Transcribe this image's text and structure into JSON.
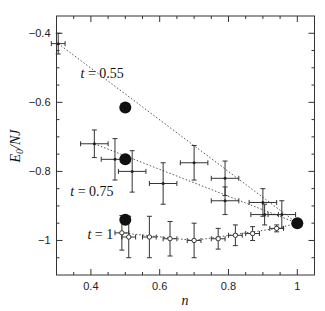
{
  "chart_data": {
    "type": "scatter",
    "title": "",
    "xlabel": "n",
    "ylabel": "E0/NJ",
    "xlim": [
      0.3,
      1.05
    ],
    "ylim": [
      -1.1,
      -0.35
    ],
    "xticks": [
      0.4,
      0.6,
      0.8,
      1
    ],
    "xtick_labels": [
      "0.4",
      "0.6",
      "0.8",
      "1"
    ],
    "yticks": [
      -0.4,
      -0.6,
      -0.8,
      -1
    ],
    "ytick_labels": [
      "−0.4",
      "−0.6",
      "−0.8",
      "−1"
    ],
    "grid": false,
    "series": [
      {
        "name": "t = 0.55",
        "label": "t = 0.55",
        "marker": "cross",
        "points": [
          {
            "x": 0.305,
            "y": -0.43,
            "xerr": 0.02,
            "yerr": 0.03
          },
          {
            "x": 0.7,
            "y": -0.775,
            "xerr": 0.04,
            "yerr": 0.05
          },
          {
            "x": 0.79,
            "y": -0.82,
            "xerr": 0.04,
            "yerr": 0.05
          },
          {
            "x": 0.9,
            "y": -0.89,
            "xerr": 0.04,
            "yerr": 0.04
          },
          {
            "x": 0.955,
            "y": -0.925,
            "xerr": 0.04,
            "yerr": 0.04
          }
        ]
      },
      {
        "name": "t = 0.75",
        "label": "t = 0.75",
        "marker": "cross",
        "points": [
          {
            "x": 0.41,
            "y": -0.72,
            "xerr": 0.04,
            "yerr": 0.04
          },
          {
            "x": 0.47,
            "y": -0.765,
            "xerr": 0.04,
            "yerr": 0.06
          },
          {
            "x": 0.52,
            "y": -0.8,
            "xerr": 0.04,
            "yerr": 0.06
          },
          {
            "x": 0.61,
            "y": -0.835,
            "xerr": 0.04,
            "yerr": 0.06
          },
          {
            "x": 0.79,
            "y": -0.885,
            "xerr": 0.04,
            "yerr": 0.04
          },
          {
            "x": 0.905,
            "y": -0.925,
            "xerr": 0.04,
            "yerr": 0.03
          }
        ]
      },
      {
        "name": "t = 1",
        "label": "t = 1",
        "marker": "open-circle",
        "points": [
          {
            "x": 0.49,
            "y": -0.978,
            "xerr": 0.02,
            "yerr": 0.05
          },
          {
            "x": 0.51,
            "y": -0.99,
            "xerr": 0.02,
            "yerr": 0.06
          },
          {
            "x": 0.57,
            "y": -0.99,
            "xerr": 0.02,
            "yerr": 0.06
          },
          {
            "x": 0.63,
            "y": -0.995,
            "xerr": 0.02,
            "yerr": 0.05
          },
          {
            "x": 0.7,
            "y": -1.0,
            "xerr": 0.02,
            "yerr": 0.05
          },
          {
            "x": 0.77,
            "y": -0.995,
            "xerr": 0.02,
            "yerr": 0.03
          },
          {
            "x": 0.82,
            "y": -0.985,
            "xerr": 0.02,
            "yerr": 0.03
          },
          {
            "x": 0.87,
            "y": -0.98,
            "xerr": 0.02,
            "yerr": 0.02
          },
          {
            "x": 0.94,
            "y": -0.965,
            "xerr": 0.02,
            "yerr": 0.01
          }
        ]
      }
    ],
    "reference_points": [
      {
        "x": 0.5,
        "y": -0.615,
        "series": "t = 0.55"
      },
      {
        "x": 0.5,
        "y": -0.765,
        "series": "t = 0.75"
      },
      {
        "x": 0.5,
        "y": -0.94,
        "series": "t = 1"
      },
      {
        "x": 1.0,
        "y": -0.95,
        "series": "all"
      }
    ],
    "annotations": [
      {
        "text": "t = 0.55",
        "x": 0.37,
        "y": -0.53
      },
      {
        "text": "t = 0.75",
        "x": 0.34,
        "y": -0.87
      },
      {
        "text": "t = 1",
        "x": 0.39,
        "y": -0.995
      }
    ]
  }
}
